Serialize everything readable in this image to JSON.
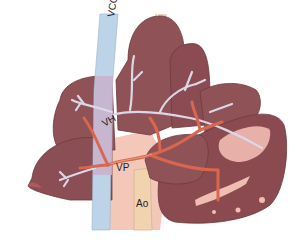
{
  "figure": {
    "labels": {
      "vcc": "VCC",
      "vh": "VH",
      "vp": "VP",
      "ao": "Ao"
    }
  },
  "colors": {
    "background": "#ffffff",
    "liver_lobe": "#8e5257",
    "liver_lobe_dark": "#7a4248",
    "liver_lobe_light": "#a06469",
    "lobe_outline": "#6e3a40",
    "vena_cava": "#bcd3e8",
    "vena_cava_lower": "#c9b6cf",
    "hepatic_veins": "#d8d4e0",
    "portal_vein": "#d9664f",
    "portal_vein_highlight": "#f09a84",
    "aorta": "#f2d3b0",
    "pale_tissue": "#f3c8b8",
    "vessel_lines": "#b9a9a9"
  }
}
